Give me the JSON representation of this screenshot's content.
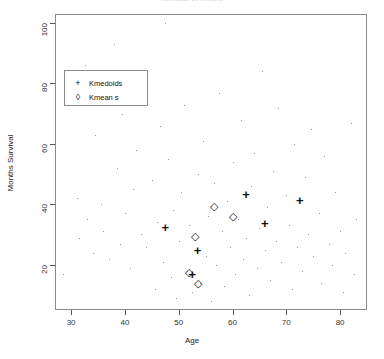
{
  "chart_data": {
    "type": "scatter",
    "title": "Kmedoids vs Kmeans",
    "xlabel": "Age",
    "ylabel": "Months Survival",
    "xlim": [
      27,
      85
    ],
    "ylim": [
      5,
      103
    ],
    "xticks": [
      30,
      40,
      50,
      60,
      70,
      80
    ],
    "yticks": [
      20,
      40,
      60,
      80,
      100
    ],
    "grid": false,
    "legend_position": "upper-left",
    "series": [
      {
        "name": "data-points",
        "marker": "dot",
        "points": [
          [
            28.5,
            17
          ],
          [
            31.0,
            42
          ],
          [
            31.5,
            29
          ],
          [
            32.5,
            86
          ],
          [
            33.0,
            35
          ],
          [
            34.0,
            24
          ],
          [
            34.5,
            63
          ],
          [
            35.5,
            40
          ],
          [
            36.0,
            31
          ],
          [
            37.0,
            22
          ],
          [
            38.0,
            93
          ],
          [
            38.5,
            52
          ],
          [
            39.0,
            27
          ],
          [
            39.5,
            70
          ],
          [
            40.0,
            37
          ],
          [
            41.0,
            19
          ],
          [
            41.5,
            45
          ],
          [
            42.0,
            58
          ],
          [
            43.0,
            30
          ],
          [
            43.5,
            81
          ],
          [
            44.0,
            26
          ],
          [
            45.0,
            48
          ],
          [
            45.5,
            12
          ],
          [
            46.0,
            34
          ],
          [
            46.5,
            66
          ],
          [
            47.0,
            21
          ],
          [
            47.5,
            100
          ],
          [
            48.0,
            55
          ],
          [
            48.5,
            16
          ],
          [
            49.0,
            38
          ],
          [
            49.5,
            9
          ],
          [
            50.0,
            28
          ],
          [
            50.5,
            44
          ],
          [
            51.0,
            73
          ],
          [
            51.5,
            18
          ],
          [
            52.0,
            33
          ],
          [
            52.5,
            11
          ],
          [
            53.0,
            25
          ],
          [
            53.5,
            50
          ],
          [
            54.0,
            14
          ],
          [
            54.5,
            61
          ],
          [
            55.0,
            23
          ],
          [
            55.5,
            36
          ],
          [
            56.0,
            8
          ],
          [
            56.5,
            47
          ],
          [
            57.0,
            20
          ],
          [
            57.5,
            77
          ],
          [
            58.0,
            31
          ],
          [
            58.5,
            13
          ],
          [
            59.0,
            41
          ],
          [
            59.5,
            26
          ],
          [
            60.0,
            54
          ],
          [
            60.5,
            17
          ],
          [
            61.0,
            35
          ],
          [
            61.5,
            68
          ],
          [
            62.0,
            22
          ],
          [
            62.5,
            29
          ],
          [
            63.0,
            10
          ],
          [
            63.5,
            46
          ],
          [
            64.0,
            57
          ],
          [
            64.5,
            19
          ],
          [
            65.0,
            32
          ],
          [
            65.5,
            84
          ],
          [
            66.0,
            25
          ],
          [
            66.5,
            39
          ],
          [
            67.0,
            15
          ],
          [
            67.5,
            51
          ],
          [
            68.0,
            28
          ],
          [
            68.5,
            72
          ],
          [
            69.0,
            21
          ],
          [
            70.0,
            43
          ],
          [
            70.5,
            33
          ],
          [
            71.0,
            12
          ],
          [
            71.5,
            60
          ],
          [
            72.0,
            26
          ],
          [
            73.0,
            18
          ],
          [
            73.5,
            49
          ],
          [
            74.0,
            30
          ],
          [
            74.5,
            65
          ],
          [
            75.0,
            23
          ],
          [
            76.0,
            37
          ],
          [
            76.5,
            14
          ],
          [
            77.0,
            56
          ],
          [
            78.0,
            27
          ],
          [
            78.5,
            20
          ],
          [
            79.0,
            44
          ],
          [
            80.0,
            31
          ],
          [
            80.5,
            11
          ],
          [
            81.0,
            24
          ],
          [
            82.0,
            67
          ],
          [
            82.5,
            17
          ],
          [
            83.0,
            35
          ]
        ]
      },
      {
        "name": "Kmedoids",
        "marker": "plus",
        "points": [
          [
            47.5,
            32
          ],
          [
            53.5,
            24.5
          ],
          [
            52.5,
            16.5
          ],
          [
            62.5,
            43
          ],
          [
            66.0,
            33.5
          ],
          [
            72.5,
            41
          ]
        ]
      },
      {
        "name": "Kmean s",
        "marker": "diamond",
        "points": [
          [
            56.5,
            39.5
          ],
          [
            53.0,
            29.5
          ],
          [
            52.0,
            17.5
          ],
          [
            53.5,
            14
          ],
          [
            60.0,
            36
          ]
        ]
      }
    ]
  },
  "legend": {
    "items": [
      {
        "label": "Kmedoids",
        "marker": "+"
      },
      {
        "label": "Kmean s",
        "marker": "◊"
      }
    ]
  }
}
